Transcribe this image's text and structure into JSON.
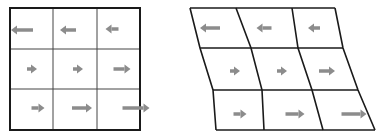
{
  "figure": {
    "colors": {
      "grid_line": "#1a1a1a",
      "inner_line": "#444444",
      "arrow": "#8c8c8c",
      "background": "#ffffff"
    }
  },
  "left_grid": {
    "outer": {
      "x": 10,
      "y": 8,
      "w": 130,
      "h": 122
    },
    "v_lines": [
      53,
      97
    ],
    "h_lines": [
      49,
      89
    ],
    "arrows": [
      {
        "cx": 22,
        "cy": 30,
        "dir": "left",
        "len": 22
      },
      {
        "cx": 68,
        "cy": 30,
        "dir": "left",
        "len": 16
      },
      {
        "cx": 112,
        "cy": 29,
        "dir": "left",
        "len": 13
      },
      {
        "cx": 32,
        "cy": 69,
        "dir": "right",
        "len": 10
      },
      {
        "cx": 78,
        "cy": 69,
        "dir": "right",
        "len": 10
      },
      {
        "cx": 122,
        "cy": 69,
        "dir": "right",
        "len": 17
      },
      {
        "cx": 38,
        "cy": 108,
        "dir": "right",
        "len": 13
      },
      {
        "cx": 82,
        "cy": 108,
        "dir": "right",
        "len": 20
      },
      {
        "cx": 136,
        "cy": 108,
        "dir": "right",
        "len": 27
      }
    ]
  },
  "right_grid": {
    "vertices": [
      [
        [
          190,
          8
        ],
        [
          236,
          8
        ],
        [
          292,
          8
        ],
        [
          335,
          8
        ]
      ],
      [
        [
          200,
          48
        ],
        [
          251,
          48
        ],
        [
          298,
          48
        ],
        [
          343,
          48
        ]
      ],
      [
        [
          213,
          90
        ],
        [
          262,
          90
        ],
        [
          312,
          90
        ],
        [
          358,
          90
        ]
      ],
      [
        [
          216,
          130
        ],
        [
          264,
          130
        ],
        [
          323,
          130
        ],
        [
          375,
          130
        ]
      ]
    ],
    "arrows": [
      {
        "cx": 210,
        "cy": 28,
        "dir": "left",
        "len": 20
      },
      {
        "cx": 264,
        "cy": 28,
        "dir": "left",
        "len": 15
      },
      {
        "cx": 314,
        "cy": 28,
        "dir": "left",
        "len": 12
      },
      {
        "cx": 235,
        "cy": 71,
        "dir": "right",
        "len": 10
      },
      {
        "cx": 282,
        "cy": 71,
        "dir": "right",
        "len": 10
      },
      {
        "cx": 327,
        "cy": 71,
        "dir": "right",
        "len": 16
      },
      {
        "cx": 240,
        "cy": 114,
        "dir": "right",
        "len": 13
      },
      {
        "cx": 295,
        "cy": 114,
        "dir": "right",
        "len": 19
      },
      {
        "cx": 354,
        "cy": 114,
        "dir": "right",
        "len": 25
      }
    ]
  }
}
